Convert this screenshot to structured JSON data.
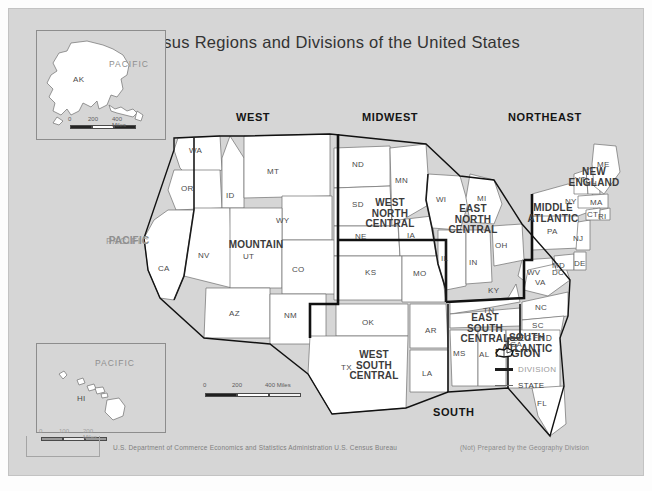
{
  "title": "Census Regions and Divisions of the United States",
  "colors": {
    "map_background": "#d6d6d6",
    "state_fill": "#ffffff",
    "state_outline": "#6f6f6f",
    "division_outline": "#1a1a1a",
    "region_outline": "#111111",
    "text": "#2a2a2a"
  },
  "insets": {
    "alaska": {
      "state": "AK",
      "ocean": "PACIFIC",
      "scale": {
        "start": "0",
        "mid": "200",
        "end": "400 Miles"
      }
    },
    "hawaii": {
      "state": "HI",
      "ocean": "PACIFIC",
      "scale": {
        "start": "0",
        "mid": "100",
        "end": "200 Miles"
      }
    }
  },
  "main_scale": {
    "start": "0",
    "mid": "200",
    "end": "400 Miles"
  },
  "oceans": [
    {
      "name": "PACIFIC",
      "x": 98,
      "y": 228
    }
  ],
  "regions": [
    {
      "name": "WEST",
      "x": 250,
      "y": 110
    },
    {
      "name": "MIDWEST",
      "x": 386,
      "y": 110
    },
    {
      "name": "NORTHEAST",
      "x": 547,
      "y": 110
    },
    {
      "name": "SOUTH",
      "x": 451,
      "y": 405
    }
  ],
  "divisions": [
    {
      "name": "PACIFIC",
      "lines": [
        "PACIFIC"
      ],
      "x": 121,
      "y": 233
    },
    {
      "name": "MOUNTAIN",
      "lines": [
        "MOUNTAIN"
      ],
      "x": 248,
      "y": 238
    },
    {
      "name": "WEST NORTH CENTRAL",
      "lines": [
        "WEST",
        "NORTH",
        "CENTRAL"
      ],
      "x": 382,
      "y": 208
    },
    {
      "name": "EAST NORTH CENTRAL",
      "lines": [
        "EAST",
        "NORTH",
        "CENTRAL"
      ],
      "x": 465,
      "y": 212
    },
    {
      "name": "NEW ENGLAND",
      "lines": [
        "NEW",
        "ENGLAND"
      ],
      "x": 586,
      "y": 168
    },
    {
      "name": "MIDDLE ATLANTIC",
      "lines": [
        "MIDDLE",
        "ATLANTIC"
      ],
      "x": 545,
      "y": 203
    },
    {
      "name": "WEST SOUTH CENTRAL",
      "lines": [
        "WEST",
        "SOUTH",
        "CENTRAL"
      ],
      "x": 366,
      "y": 358
    },
    {
      "name": "EAST SOUTH CENTRAL",
      "lines": [
        "EAST",
        "SOUTH",
        "CENTRAL"
      ],
      "x": 477,
      "y": 320
    },
    {
      "name": "SOUTH ATLANTIC",
      "lines": [
        "SOUTH",
        "ATLANTIC"
      ],
      "x": 518,
      "y": 333
    }
  ],
  "states": [
    {
      "abbr": "WA",
      "x": 188,
      "y": 143
    },
    {
      "abbr": "OR",
      "x": 180,
      "y": 181
    },
    {
      "abbr": "ID",
      "x": 225,
      "y": 188
    },
    {
      "abbr": "MT",
      "x": 266,
      "y": 164
    },
    {
      "abbr": "WY",
      "x": 275,
      "y": 213
    },
    {
      "abbr": "NV",
      "x": 197,
      "y": 248
    },
    {
      "abbr": "CA",
      "x": 157,
      "y": 261
    },
    {
      "abbr": "UT",
      "x": 242,
      "y": 249
    },
    {
      "abbr": "CO",
      "x": 291,
      "y": 262
    },
    {
      "abbr": "AZ",
      "x": 228,
      "y": 306
    },
    {
      "abbr": "NM",
      "x": 283,
      "y": 308
    },
    {
      "abbr": "ND",
      "x": 351,
      "y": 157
    },
    {
      "abbr": "SD",
      "x": 351,
      "y": 197
    },
    {
      "abbr": "MN",
      "x": 394,
      "y": 173
    },
    {
      "abbr": "NE",
      "x": 354,
      "y": 229
    },
    {
      "abbr": "IA",
      "x": 406,
      "y": 228
    },
    {
      "abbr": "KS",
      "x": 364,
      "y": 265
    },
    {
      "abbr": "MO",
      "x": 412,
      "y": 266
    },
    {
      "abbr": "WI",
      "x": 435,
      "y": 192
    },
    {
      "abbr": "MI",
      "x": 476,
      "y": 191
    },
    {
      "abbr": "IL",
      "x": 440,
      "y": 251
    },
    {
      "abbr": "IN",
      "x": 468,
      "y": 255
    },
    {
      "abbr": "OH",
      "x": 494,
      "y": 238
    },
    {
      "abbr": "OK",
      "x": 361,
      "y": 315
    },
    {
      "abbr": "TX",
      "x": 340,
      "y": 360
    },
    {
      "abbr": "AR",
      "x": 424,
      "y": 323
    },
    {
      "abbr": "LA",
      "x": 421,
      "y": 366
    },
    {
      "abbr": "MS",
      "x": 452,
      "y": 346
    },
    {
      "abbr": "AL",
      "x": 478,
      "y": 347
    },
    {
      "abbr": "KY",
      "x": 487,
      "y": 283
    },
    {
      "abbr": "TN",
      "x": 482,
      "y": 303
    },
    {
      "abbr": "WV",
      "x": 526,
      "y": 265
    },
    {
      "abbr": "VA",
      "x": 534,
      "y": 275
    },
    {
      "abbr": "NC",
      "x": 534,
      "y": 300
    },
    {
      "abbr": "SC",
      "x": 531,
      "y": 318
    },
    {
      "abbr": "GA",
      "x": 509,
      "y": 337
    },
    {
      "abbr": "FL",
      "x": 536,
      "y": 396
    },
    {
      "abbr": "MD",
      "x": 551,
      "y": 258
    },
    {
      "abbr": "DC",
      "x": 551,
      "y": 265
    },
    {
      "abbr": "DE",
      "x": 573,
      "y": 256
    },
    {
      "abbr": "PA",
      "x": 546,
      "y": 224
    },
    {
      "abbr": "NJ",
      "x": 572,
      "y": 231
    },
    {
      "abbr": "NY",
      "x": 564,
      "y": 194
    },
    {
      "abbr": "CT",
      "x": 586,
      "y": 207
    },
    {
      "abbr": "RI",
      "x": 597,
      "y": 209
    },
    {
      "abbr": "MA",
      "x": 589,
      "y": 195
    },
    {
      "abbr": "VT",
      "x": 574,
      "y": 172
    },
    {
      "abbr": "NH",
      "x": 584,
      "y": 176
    },
    {
      "abbr": "ME",
      "x": 596,
      "y": 157
    }
  ],
  "legend": {
    "title": "LEGEND",
    "items": [
      {
        "label": "REGION"
      },
      {
        "label": "DIVISION"
      },
      {
        "label": "STATE"
      }
    ]
  },
  "footer": {
    "left": "U.S. Department of Commerce  Economics and Statistics Administration  U.S. Census Bureau",
    "right": "(Not) Prepared by the Geography Division"
  }
}
